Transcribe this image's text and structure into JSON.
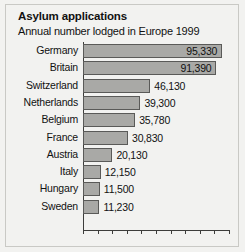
{
  "chart_data": {
    "type": "bar",
    "orientation": "horizontal",
    "title": "Asylum applications",
    "subtitle": "Annual number lodged in Europe 1999",
    "xlabel": "",
    "ylabel": "",
    "categories": [
      "Germany",
      "Britain",
      "Switzerland",
      "Netherlands",
      "Belgium",
      "France",
      "Austria",
      "Italy",
      "Hungary",
      "Sweden"
    ],
    "values": [
      95330,
      91390,
      46130,
      39300,
      35780,
      30830,
      20130,
      12150,
      11500,
      11230
    ],
    "value_labels": [
      "95,330",
      "91,390",
      "46,130",
      "39,300",
      "35,780",
      "30,830",
      "20,130",
      "12,150",
      "11,500",
      "11,230"
    ],
    "label_inside": [
      true,
      true,
      false,
      false,
      false,
      false,
      false,
      false,
      false,
      false
    ],
    "xlim": [
      0,
      100000
    ],
    "tick_count": 11,
    "tick_step": 10000,
    "grid": false,
    "legend": null,
    "bar_color": "#a9a9a6",
    "bar_border_color": "#5a5a58",
    "background_color": "#f2f2f0",
    "axis_color": "#3d3d3b",
    "text_color": "#111111"
  }
}
